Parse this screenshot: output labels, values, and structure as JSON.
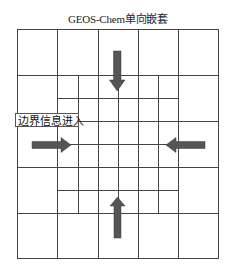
{
  "diagram": {
    "title": "GEOS-Chem单向嵌套",
    "label": "边界信息进入",
    "colors": {
      "line": "#444444",
      "arrow": "#555555",
      "background": "#ffffff"
    },
    "outer_grid": {
      "rows": 5,
      "cols": 5
    },
    "nested_grid": {
      "rows": 6,
      "cols": 6,
      "position": "center 3x3 coarse cells refined 2x"
    },
    "arrows": [
      {
        "id": "top",
        "direction": "down"
      },
      {
        "id": "left",
        "direction": "right"
      },
      {
        "id": "right",
        "direction": "left"
      },
      {
        "id": "bottom",
        "direction": "up"
      }
    ]
  }
}
